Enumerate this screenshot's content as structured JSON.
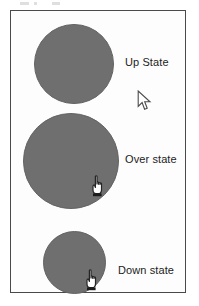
{
  "figure": {
    "frame": {
      "border_color": "#4a4a4a",
      "background_color": "#fdfdfd"
    },
    "shape_color": "#6f6f6f",
    "label_color": "#1c1c1c"
  },
  "states": [
    {
      "id": "up",
      "label": "Up State",
      "shape": "circle",
      "size_px": 80,
      "cursor": "arrow-cursor",
      "cursor_inside_shape": false
    },
    {
      "id": "over",
      "label": "Over state",
      "shape": "circle",
      "size_px": 96,
      "cursor": "pointing-hand-cursor",
      "cursor_inside_shape": true
    },
    {
      "id": "down",
      "label": "Down state",
      "shape": "circle",
      "size_px": 63,
      "cursor": "pointing-hand-cursor",
      "cursor_inside_shape": true
    }
  ]
}
